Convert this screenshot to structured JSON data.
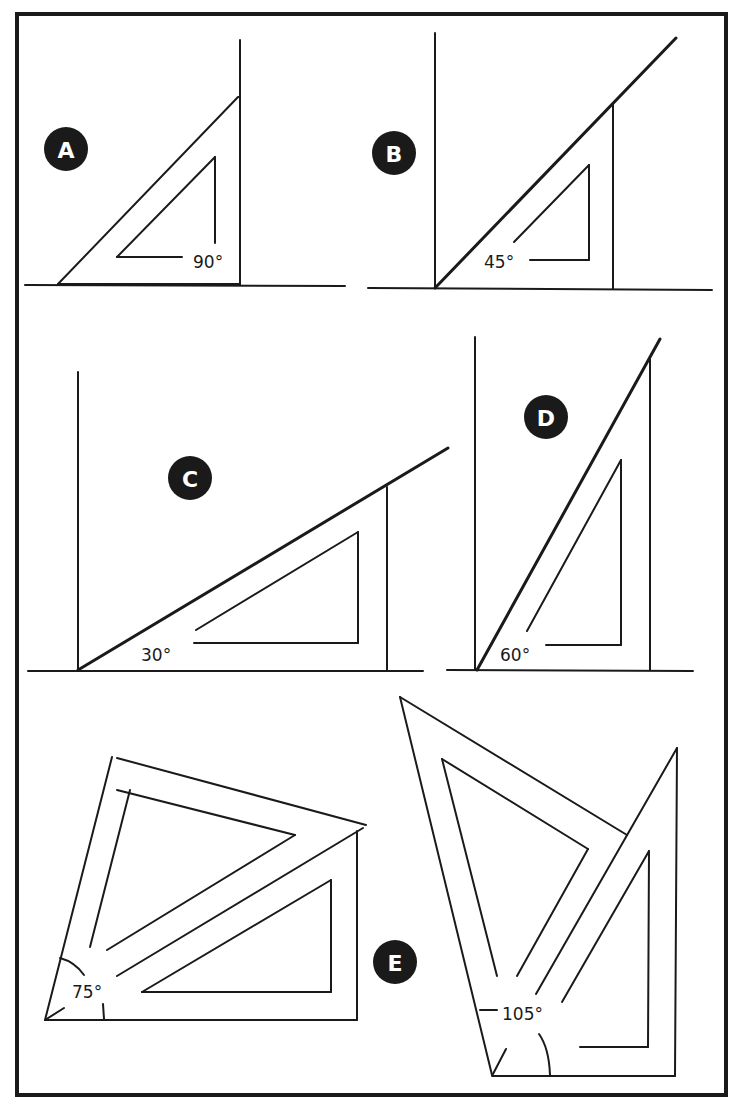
{
  "figure": {
    "panels": [
      {
        "id": "A",
        "label": "A",
        "angle_label": "90°"
      },
      {
        "id": "B",
        "label": "B",
        "angle_label": "45°"
      },
      {
        "id": "C",
        "label": "C",
        "angle_label": "30°"
      },
      {
        "id": "D",
        "label": "D",
        "angle_label": "60°"
      },
      {
        "id": "E",
        "label": "E",
        "angle_labels": [
          "75°",
          "105°"
        ]
      }
    ]
  }
}
